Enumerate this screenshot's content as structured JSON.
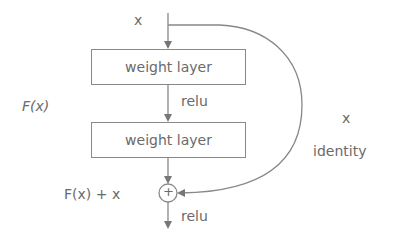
{
  "diagram": {
    "input_label": "x",
    "layers": [
      {
        "label": "weight layer"
      },
      {
        "label": "weight layer"
      }
    ],
    "activation_between": "relu",
    "activation_output": "relu",
    "residual_function_label": "F(x)",
    "sum_label": "F(x) + x",
    "add_symbol": "+",
    "shortcut": {
      "x_label": "x",
      "identity_label": "identity"
    },
    "colors": {
      "stroke": "#888888",
      "text": "#6a6a6a"
    }
  }
}
